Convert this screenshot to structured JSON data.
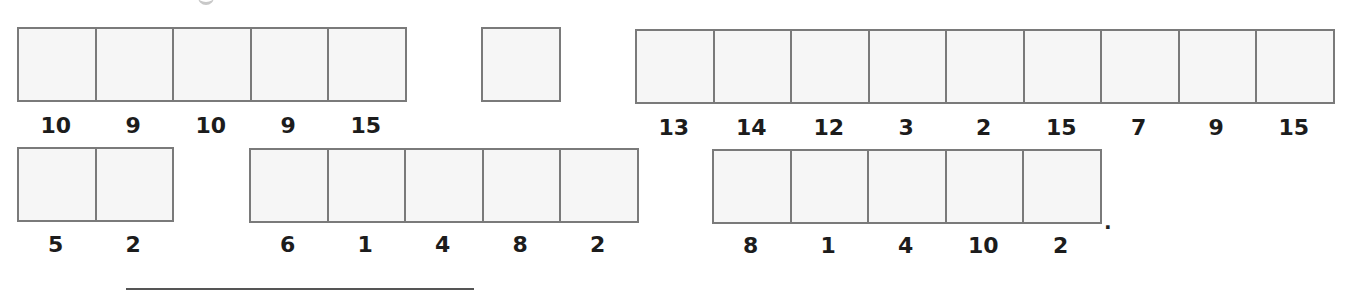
{
  "worksheet": {
    "rows": [
      {
        "groups": [
          {
            "id": "group-a",
            "box_count": 5,
            "labels": [
              "10",
              "9",
              "10",
              "9",
              "15"
            ]
          },
          {
            "id": "group-b",
            "box_count": 1,
            "labels": []
          },
          {
            "id": "group-c",
            "box_count": 9,
            "labels": [
              "13",
              "14",
              "12",
              "3",
              "2",
              "15",
              "7",
              "9",
              "15"
            ]
          }
        ]
      },
      {
        "groups": [
          {
            "id": "group-d",
            "box_count": 2,
            "labels": [
              "5",
              "2"
            ]
          },
          {
            "id": "group-e",
            "box_count": 5,
            "labels": [
              "6",
              "1",
              "4",
              "8",
              "2"
            ]
          },
          {
            "id": "group-f",
            "box_count": 5,
            "labels": [
              "8",
              "1",
              "4",
              "10",
              "2"
            ]
          }
        ]
      }
    ],
    "terminal_punctuation": ".",
    "colors": {
      "box_border": "#7a7a7a",
      "box_fill": "#f6f6f6",
      "label_text": "#1c1c1c",
      "background": "#ffffff"
    }
  }
}
